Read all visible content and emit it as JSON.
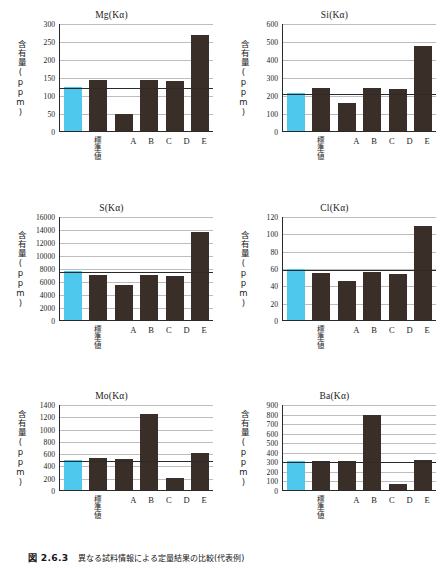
{
  "figure": {
    "caption_number": "図 2.6.3",
    "caption_text": "異なる試料情報による定量結果の比較(代表例)"
  },
  "common": {
    "ylabel": "含有量(ppm)",
    "std_label": "標準値",
    "categories": [
      "標準値",
      "A",
      "B",
      "C",
      "D",
      "E"
    ],
    "std_bar_color": "#4ec8ec",
    "bar_color": "#3a2e28",
    "gridline_color": "#bdbdbd",
    "axis_color": "#2a2a2a"
  },
  "chart_data": [
    {
      "type": "bar",
      "title": "Mg(Kα)",
      "xlabel": "",
      "ylabel": "含有量(ppm)",
      "categories": [
        "標準値",
        "A",
        "B",
        "C",
        "D",
        "E"
      ],
      "values": [
        122,
        142,
        48,
        142,
        140,
        267
      ],
      "standard_value": 122,
      "ylim": [
        0,
        300
      ],
      "yticks": [
        0,
        50,
        100,
        150,
        200,
        250,
        300
      ],
      "grid": true,
      "legend": "none"
    },
    {
      "type": "bar",
      "title": "Si(Kα)",
      "xlabel": "",
      "ylabel": "含有量(ppm)",
      "categories": [
        "標準値",
        "A",
        "B",
        "C",
        "D",
        "E"
      ],
      "values": [
        212,
        238,
        158,
        240,
        232,
        472
      ],
      "standard_value": 212,
      "ylim": [
        0,
        600
      ],
      "yticks": [
        0,
        100,
        200,
        300,
        400,
        500,
        600
      ],
      "grid": true,
      "legend": "none"
    },
    {
      "type": "bar",
      "title": "S(Kα)",
      "xlabel": "",
      "ylabel": "含有量(ppm)",
      "categories": [
        "標準値",
        "A",
        "B",
        "C",
        "D",
        "E"
      ],
      "values": [
        7500,
        6950,
        5450,
        7000,
        6800,
        13500
      ],
      "standard_value": 7500,
      "ylim": [
        0,
        16000
      ],
      "yticks": [
        0,
        2000,
        4000,
        6000,
        8000,
        10000,
        12000,
        14000,
        16000
      ],
      "grid": true,
      "legend": "none"
    },
    {
      "type": "bar",
      "title": "Cl(Kα)",
      "xlabel": "",
      "ylabel": "含有量(ppm)",
      "categories": [
        "標準値",
        "A",
        "B",
        "C",
        "D",
        "E"
      ],
      "values": [
        59,
        54,
        45,
        55,
        53,
        108
      ],
      "standard_value": 59,
      "ylim": [
        0,
        120
      ],
      "yticks": [
        0,
        20,
        40,
        60,
        80,
        100,
        120
      ],
      "grid": true,
      "legend": "none"
    },
    {
      "type": "bar",
      "title": "Mo(Kα)",
      "xlabel": "",
      "ylabel": "含有量(ppm)",
      "categories": [
        "標準値",
        "A",
        "B",
        "C",
        "D",
        "E"
      ],
      "values": [
        490,
        520,
        510,
        1230,
        190,
        595
      ],
      "standard_value": 490,
      "ylim": [
        0,
        1400
      ],
      "yticks": [
        0,
        200,
        400,
        600,
        800,
        1000,
        1200,
        1400
      ],
      "grid": true,
      "legend": "none"
    },
    {
      "type": "bar",
      "title": "Ba(Kα)",
      "xlabel": "",
      "ylabel": "含有量(ppm)",
      "categories": [
        "標準値",
        "A",
        "B",
        "C",
        "D",
        "E"
      ],
      "values": [
        300,
        308,
        305,
        785,
        65,
        318
      ],
      "standard_value": 300,
      "ylim": [
        0,
        900
      ],
      "yticks": [
        0,
        100,
        200,
        300,
        400,
        500,
        600,
        700,
        800,
        900
      ],
      "grid": true,
      "legend": "none"
    }
  ]
}
